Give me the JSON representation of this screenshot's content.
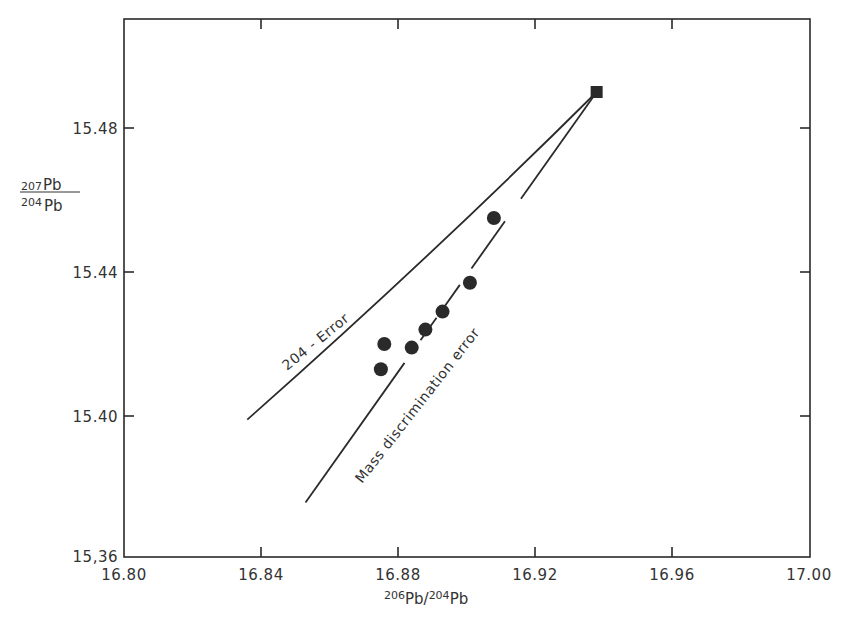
{
  "chart_data": {
    "type": "scatter",
    "title": "",
    "xlabel": "206Pb/204Pb",
    "xlabel_parts": {
      "sup1": "206",
      "base1": "Pb/",
      "sup2": "204",
      "base2": "Pb"
    },
    "ylabel": "207Pb/204Pb",
    "ylabel_parts": {
      "num_sup": "207",
      "num_base": "Pb",
      "den_sup": "204",
      "den_base": "Pb"
    },
    "xlim": [
      16.8,
      17.0
    ],
    "ylim": [
      15.36,
      15.5
    ],
    "x_ticks": [
      16.8,
      16.84,
      16.88,
      16.92,
      16.96,
      17.0
    ],
    "x_tick_labels": [
      "16.80",
      "16.84",
      "16.88",
      "16.92",
      "16.96",
      "17.00"
    ],
    "y_ticks": [
      15.36,
      15.4,
      15.44,
      15.48
    ],
    "y_tick_labels": [
      "15,36",
      "15.40",
      "15.44",
      "15.48"
    ],
    "grid": false,
    "legend": null,
    "series": [
      {
        "name": "Measured samples",
        "marker": "circle",
        "points": [
          {
            "x": 16.876,
            "y": 15.42
          },
          {
            "x": 16.875,
            "y": 15.413
          },
          {
            "x": 16.884,
            "y": 15.419
          },
          {
            "x": 16.888,
            "y": 15.424
          },
          {
            "x": 16.893,
            "y": 15.429
          },
          {
            "x": 16.901,
            "y": 15.437
          },
          {
            "x": 16.908,
            "y": 15.455
          }
        ]
      },
      {
        "name": "Reference value",
        "marker": "square",
        "points": [
          {
            "x": 16.938,
            "y": 15.49
          }
        ]
      }
    ],
    "lines": [
      {
        "name": "204-Error",
        "from": {
          "x": 16.836,
          "y": 15.399
        },
        "to": {
          "x": 16.938,
          "y": 15.49
        },
        "style": "solid-curved"
      },
      {
        "name": "Mass discrimination error",
        "from": {
          "x": 16.853,
          "y": 15.376
        },
        "to": {
          "x": 16.938,
          "y": 15.49
        },
        "style": "solid-broken-at-points"
      }
    ],
    "annotations": [
      {
        "text": "204 - Error",
        "x": 16.855,
        "y": 15.418,
        "rotation_deg": -39
      },
      {
        "text": "Mass discrimination error",
        "x": 16.885,
        "y": 15.405,
        "rotation_deg": -52
      }
    ]
  },
  "colors": {
    "ink": "#2a2a2a",
    "background": "#ffffff"
  }
}
